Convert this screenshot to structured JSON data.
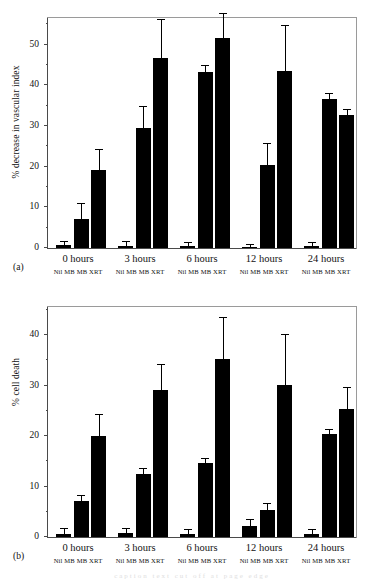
{
  "figure": {
    "panel_a_tag": "(a)",
    "panel_b_tag": "(b)",
    "bottom_caption": "caption text cut off at page edge"
  },
  "chart_data": [
    {
      "type": "bar",
      "panel": "(a)",
      "title": "",
      "xlabel": "",
      "ylabel": "% decrease in vascular index",
      "ylim": [
        0,
        57
      ],
      "yticks": [
        0,
        10,
        20,
        30,
        40,
        50
      ],
      "yticks_minor": [
        5,
        15,
        25,
        35,
        45,
        55
      ],
      "grid": false,
      "legend": "none",
      "bar_color": "#000000",
      "categories": [
        "0 hours",
        "3 hours",
        "6 hours",
        "12 hours",
        "24 hours"
      ],
      "subcategories": [
        "Nil",
        "MB",
        "MB XRT"
      ],
      "sublabel_text": "Nil MB MB XRT",
      "series": [
        {
          "name": "Nil",
          "values": [
            0.7,
            0.4,
            0.5,
            0.3,
            0.5
          ],
          "errors": [
            0.9,
            1.1,
            0.8,
            0.5,
            0.7
          ]
        },
        {
          "name": "MB",
          "values": [
            7.2,
            29.4,
            43.3,
            20.4,
            36.5
          ],
          "errors": [
            3.6,
            5.2,
            1.3,
            5.1,
            1.3
          ]
        },
        {
          "name": "MB XRT",
          "values": [
            19.2,
            46.7,
            51.5,
            43.4,
            32.7
          ],
          "errors": [
            5.0,
            9.3,
            6.0,
            11.2,
            1.1
          ]
        }
      ]
    },
    {
      "type": "bar",
      "panel": "(b)",
      "title": "",
      "xlabel": "",
      "ylabel": "% cell death",
      "ylim": [
        0,
        46
      ],
      "yticks": [
        0,
        10,
        20,
        30,
        40
      ],
      "yticks_minor": [
        5,
        15,
        25,
        35,
        45
      ],
      "grid": false,
      "legend": "none",
      "bar_color": "#000000",
      "categories": [
        "0 hours",
        "3 hours",
        "6 hours",
        "12 hours",
        "24 hours"
      ],
      "subcategories": [
        "Nil",
        "MB",
        "MB XRT"
      ],
      "sublabel_text": "Nil MB MB XRT",
      "series": [
        {
          "name": "Nil",
          "values": [
            0.6,
            0.7,
            0.6,
            2.1,
            0.5
          ],
          "errors": [
            0.9,
            0.9,
            0.8,
            1.2,
            0.9
          ]
        },
        {
          "name": "MB",
          "values": [
            7.2,
            12.4,
            14.6,
            5.4,
            20.4
          ],
          "errors": [
            1.0,
            1.0,
            0.9,
            1.1,
            0.8
          ]
        },
        {
          "name": "MB XRT",
          "values": [
            20.1,
            29.2,
            35.2,
            30.2,
            25.3
          ],
          "errors": [
            4.0,
            5.0,
            8.3,
            9.8,
            4.2
          ]
        }
      ]
    }
  ]
}
